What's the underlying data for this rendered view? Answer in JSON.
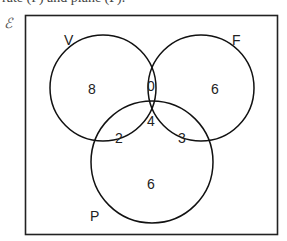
{
  "caption_fragment": "rate (F) and plane (P).",
  "diagram": {
    "type": "venn",
    "universal_set_symbol": "ℰ",
    "sets": [
      {
        "label": "V",
        "cx": 103,
        "cy": 88,
        "r": 53
      },
      {
        "label": "F",
        "cx": 201,
        "cy": 88,
        "r": 53
      },
      {
        "label": "P",
        "cx": 152,
        "cy": 162,
        "r": 61
      }
    ],
    "regions": {
      "V_only": "8",
      "F_only": "6",
      "P_only": "6",
      "V_and_F_only": "0",
      "V_and_P_only": "2",
      "F_and_P_only": "3",
      "V_and_F_and_P": "4"
    },
    "stroke_color": "#111111",
    "background": "#ffffff"
  }
}
